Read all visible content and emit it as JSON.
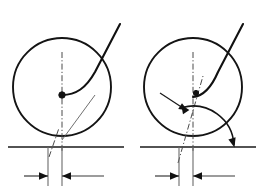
{
  "document": {
    "title": "Rolling contact geometry comparison",
    "background_color": "#ffffff",
    "width": 261,
    "height": 194,
    "line_color": "#111111",
    "thin_line_color": "#555555",
    "axis_line_color": "#4a4a4a"
  },
  "figures": [
    {
      "id": "figure-left",
      "name": "left-figure",
      "label": "",
      "circle": {
        "cx": 62,
        "cy": 87,
        "r": 49
      },
      "baseline": {
        "x1": 8,
        "y1": 147,
        "x2": 124,
        "y2": 147
      },
      "vertical_axis": {
        "x": 62,
        "y_top": 52,
        "y_bottom": 152
      },
      "inclined_axis": {
        "x1": 49,
        "y1": 157,
        "x2": 59,
        "y2": 128
      },
      "contact_dot": {
        "cx": 62,
        "cy": 95,
        "r": 3.2
      },
      "profile_curve": "M 62 95 C 76 95 86 88 95 72 L 120 24",
      "thin_leader": {
        "x1": 62,
        "y1": 140,
        "x2": 95,
        "y2": 95
      },
      "dimension": {
        "left_ext_x": 48,
        "right_ext_x": 62,
        "ext_top_y": 147,
        "ext_bottom_y": 186,
        "dim_y": 176,
        "left_tail_x": 24,
        "right_tail_x": 104
      }
    },
    {
      "id": "figure-right",
      "name": "right-figure",
      "label": "",
      "circle": {
        "cx": 193,
        "cy": 87,
        "r": 49
      },
      "baseline": {
        "x1": 140,
        "y1": 147,
        "x2": 256,
        "y2": 147
      },
      "vertical_axis": {
        "x": 193,
        "y_top": 52,
        "y_bottom": 152
      },
      "inclined_axis": {
        "x1": 178,
        "y1": 163,
        "x2": 203,
        "y2": 76
      },
      "contact_dot": {
        "cx": 196,
        "cy": 93,
        "r": 2.6
      },
      "profile_curve": "M 193 97 C 204 96 212 86 218 72 L 243 24",
      "angle_arc": {
        "cx": 193,
        "cy": 147,
        "r": 41,
        "start_deg": 255,
        "end_deg": 357
      },
      "leader_arrow": {
        "x1": 160,
        "y1": 93,
        "x2": 186,
        "y2": 110
      },
      "dimension": {
        "left_ext_x": 179,
        "right_ext_x": 193,
        "ext_top_y": 147,
        "ext_bottom_y": 186,
        "dim_y": 176,
        "left_tail_x": 155,
        "right_tail_x": 235
      }
    }
  ],
  "annotations": {
    "arrow_head_length": 9,
    "arrow_head_width": 5
  }
}
